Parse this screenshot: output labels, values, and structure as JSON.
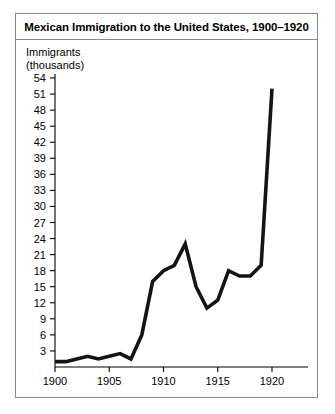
{
  "chart_data": {
    "type": "line",
    "title": "Mexican Immigration to the United States, 1900–1920",
    "xlabel": "",
    "ylabel": "Immigrants",
    "ylabel_line2": "(thousands)",
    "ylabel_full": "Immigrants (thousands)",
    "x": [
      1900,
      1901,
      1902,
      1903,
      1904,
      1905,
      1906,
      1907,
      1908,
      1909,
      1910,
      1911,
      1912,
      1913,
      1914,
      1915,
      1916,
      1917,
      1918,
      1919,
      1920
    ],
    "values": [
      1,
      1,
      1.5,
      2,
      1.5,
      2,
      2.5,
      1.5,
      6,
      16,
      18,
      19,
      23,
      15,
      11,
      12.5,
      18,
      17,
      17,
      19,
      52
    ],
    "series": [
      {
        "name": "Mexican immigrants (thousands)",
        "values": [
          1,
          1,
          1.5,
          2,
          1.5,
          2,
          2.5,
          1.5,
          6,
          16,
          18,
          19,
          23,
          15,
          11,
          12.5,
          18,
          17,
          17,
          19,
          52
        ]
      }
    ],
    "xlim": [
      1900,
      1920
    ],
    "ylim": [
      0,
      55
    ],
    "xticks": [
      1900,
      1905,
      1910,
      1915,
      1920
    ],
    "xtick_labels": [
      "1900",
      "1905",
      "1910",
      "1915",
      "1920"
    ],
    "yticks": [
      3,
      6,
      9,
      12,
      15,
      18,
      21,
      24,
      27,
      30,
      33,
      36,
      39,
      42,
      45,
      48,
      51,
      54
    ],
    "ytick_labels": [
      "3",
      "6",
      "9",
      "12",
      "15",
      "18",
      "21",
      "24",
      "27",
      "30",
      "33",
      "36",
      "39",
      "42",
      "45",
      "48",
      "51",
      "54"
    ],
    "grid": false,
    "legend": false,
    "legend_position": "none",
    "line_color": "#141414",
    "border_color": "#8a8a8a",
    "background": "#ffffff"
  }
}
